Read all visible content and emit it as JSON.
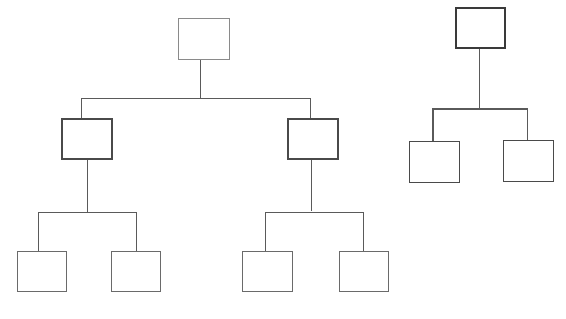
{
  "diagram": {
    "type": "tree",
    "background": "#ffffff",
    "line_color": "#5a5a5a",
    "trees": [
      {
        "id": "tree-large",
        "levels": 3,
        "nodes": [
          {
            "id": "root",
            "x": 178,
            "y": 18,
            "w": 52,
            "h": 42,
            "border": 1,
            "color": "#8a8a8a"
          },
          {
            "id": "mid-left",
            "x": 61,
            "y": 118,
            "w": 52,
            "h": 42,
            "border": 2,
            "color": "#4a4a4a"
          },
          {
            "id": "mid-right",
            "x": 287,
            "y": 118,
            "w": 52,
            "h": 42,
            "border": 2,
            "color": "#4a4a4a"
          },
          {
            "id": "leaf-1",
            "x": 17,
            "y": 251,
            "w": 50,
            "h": 41,
            "border": 1,
            "color": "#6a6a6a"
          },
          {
            "id": "leaf-2",
            "x": 111,
            "y": 251,
            "w": 50,
            "h": 41,
            "border": 1,
            "color": "#6a6a6a"
          },
          {
            "id": "leaf-3",
            "x": 242,
            "y": 251,
            "w": 51,
            "h": 41,
            "border": 1,
            "color": "#6a6a6a"
          },
          {
            "id": "leaf-4",
            "x": 339,
            "y": 251,
            "w": 50,
            "h": 41,
            "border": 1,
            "color": "#6a6a6a"
          }
        ],
        "lines": [
          {
            "kind": "v",
            "x": 200,
            "y1": 60,
            "y2": 98,
            "t": 1
          },
          {
            "kind": "h",
            "y": 98,
            "x1": 81,
            "x2": 311,
            "t": 1
          },
          {
            "kind": "v",
            "x": 81,
            "y1": 98,
            "y2": 118,
            "t": 1
          },
          {
            "kind": "v",
            "x": 310,
            "y1": 98,
            "y2": 118,
            "t": 1
          },
          {
            "kind": "v",
            "x": 87,
            "y1": 160,
            "y2": 212,
            "t": 1
          },
          {
            "kind": "h",
            "y": 212,
            "x1": 38,
            "x2": 137,
            "t": 1
          },
          {
            "kind": "v",
            "x": 38,
            "y1": 212,
            "y2": 251,
            "t": 1
          },
          {
            "kind": "v",
            "x": 136,
            "y1": 212,
            "y2": 251,
            "t": 1
          },
          {
            "kind": "v",
            "x": 311,
            "y1": 160,
            "y2": 211,
            "t": 1
          },
          {
            "kind": "h",
            "y": 212,
            "x1": 265,
            "x2": 364,
            "t": 1
          },
          {
            "kind": "v",
            "x": 265,
            "y1": 212,
            "y2": 251,
            "t": 1
          },
          {
            "kind": "v",
            "x": 363,
            "y1": 212,
            "y2": 251,
            "t": 1
          }
        ]
      },
      {
        "id": "tree-small",
        "levels": 2,
        "nodes": [
          {
            "id": "root",
            "x": 455,
            "y": 7,
            "w": 51,
            "h": 42,
            "border": 2,
            "color": "#3a3a3a"
          },
          {
            "id": "leaf-1",
            "x": 409,
            "y": 141,
            "w": 51,
            "h": 42,
            "border": 1,
            "color": "#4a4a4a"
          },
          {
            "id": "leaf-2",
            "x": 503,
            "y": 140,
            "w": 51,
            "h": 42,
            "border": 1,
            "color": "#4a4a4a"
          }
        ],
        "lines": [
          {
            "kind": "v",
            "x": 479,
            "y1": 49,
            "y2": 109,
            "t": 1
          },
          {
            "kind": "h",
            "y": 108,
            "x1": 432,
            "x2": 528,
            "t": 2
          },
          {
            "kind": "v",
            "x": 432,
            "y1": 108,
            "y2": 141,
            "t": 2
          },
          {
            "kind": "v",
            "x": 527,
            "y1": 108,
            "y2": 140,
            "t": 1
          }
        ]
      }
    ]
  }
}
